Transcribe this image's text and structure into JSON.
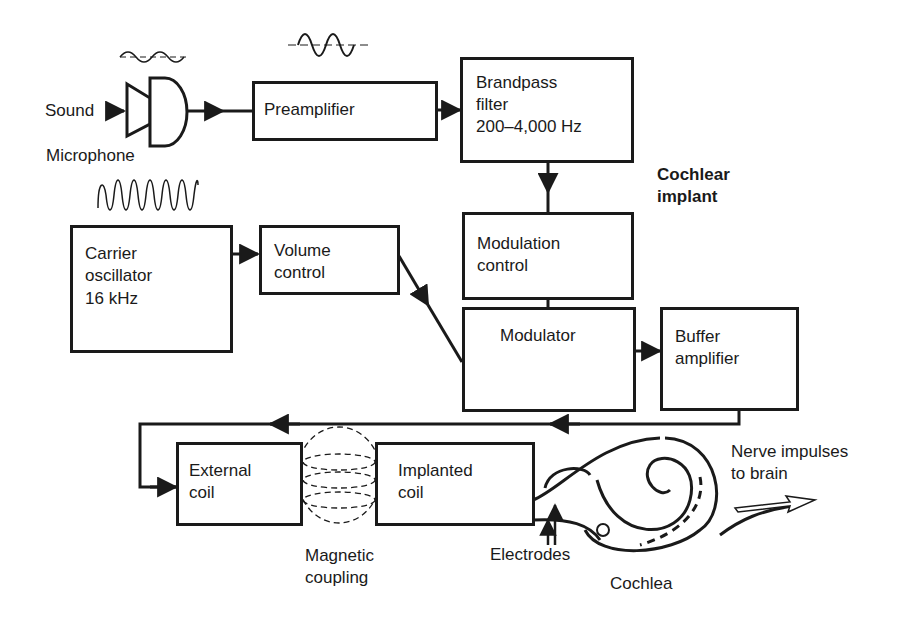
{
  "diagram": {
    "title_lines": [
      "Cochlear",
      "implant"
    ],
    "colors": {
      "ink": "#1a1a1a",
      "background": "#ffffff"
    },
    "inputs": {
      "sound": "Sound",
      "microphone": "Microphone"
    },
    "blocks": {
      "preamplifier": {
        "lines": [
          "Preamplifier"
        ]
      },
      "bandpass_filter": {
        "lines": [
          "Brandpass",
          "filter",
          "200–4,000 Hz"
        ]
      },
      "modulation_control": {
        "lines": [
          "Modulation",
          "control"
        ]
      },
      "carrier_oscillator": {
        "lines": [
          "Carrier",
          "oscillator",
          "16 kHz"
        ]
      },
      "volume_control": {
        "lines": [
          "Volume",
          "control"
        ]
      },
      "modulator": {
        "lines": [
          "Modulator"
        ]
      },
      "buffer_amplifier": {
        "lines": [
          "Buffer",
          "amplifier"
        ]
      },
      "external_coil": {
        "lines": [
          "External",
          "coil"
        ]
      },
      "implanted_coil": {
        "lines": [
          "Implanted",
          "coil"
        ]
      }
    },
    "annotations": {
      "magnetic_coupling": [
        "Magnetic",
        "coupling"
      ],
      "electrodes": "Electrodes",
      "cochlea": "Cochlea",
      "nerve_impulses": [
        "Nerve impulses",
        "to brain"
      ]
    },
    "icons": [
      "microphone-icon",
      "sound-wave-icon",
      "amplified-wave-icon",
      "carrier-wave-icon",
      "modulated-wave-icon",
      "magnetic-field-icon",
      "cochlea-icon",
      "arrow-icon"
    ]
  }
}
